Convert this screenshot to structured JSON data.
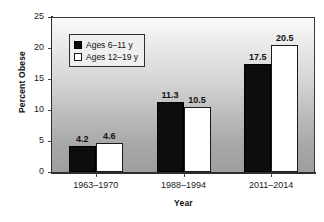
{
  "chart_data": {
    "type": "bar",
    "title": "",
    "xlabel": "Year",
    "ylabel": "Percent Obese",
    "categories": [
      "1963–1970",
      "1988–1994",
      "2011–2014"
    ],
    "series": [
      {
        "name": "Ages 6–11 y",
        "values": [
          4.2,
          11.3,
          17.5
        ],
        "color": "#0d0d0d"
      },
      {
        "name": "Ages 12–19 y",
        "values": [
          4.6,
          10.5,
          20.5
        ],
        "color": "#ffffff"
      }
    ],
    "ylim": [
      0,
      25
    ],
    "yticks": [
      0,
      5,
      10,
      15,
      20,
      25
    ],
    "ytick_labels": [
      "0",
      "5",
      "10",
      "15",
      "20",
      "25"
    ],
    "data_labels": [
      [
        "4.2",
        "4.6"
      ],
      [
        "11.3",
        "10.5"
      ],
      [
        "17.5",
        "20.5"
      ]
    ],
    "grid": false,
    "legend_position": "upper left",
    "plot_background": "vertical gradient light-gray to medium-gray"
  },
  "axes": {
    "y_title": "Percent Obese",
    "x_title": "Year"
  },
  "legend": {
    "entries": [
      {
        "label": "Ages 6–11 y",
        "swatch": "filled-black-square"
      },
      {
        "label": "Ages 12–19 y",
        "swatch": "outlined-white-square"
      }
    ]
  }
}
